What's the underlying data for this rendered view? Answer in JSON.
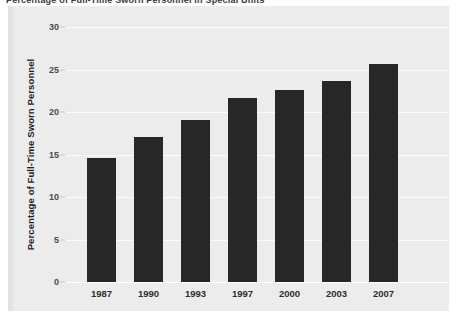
{
  "figure": {
    "top_caption_partial": "Percentage of Full-Time Sworn Personnel in Special Units",
    "background_color": "#ececed",
    "bar_color": "#272727",
    "gridline_color": "#fbfbfb"
  },
  "chart_data": {
    "type": "bar",
    "title": "",
    "xlabel": "",
    "ylabel": "Percentage of Full-Time Sworn Personnel",
    "categories": [
      "1987",
      "1990",
      "1993",
      "1997",
      "2000",
      "2003",
      "2007"
    ],
    "values": [
      14.6,
      17.1,
      19.1,
      21.7,
      22.6,
      23.7,
      25.6
    ],
    "ylim": [
      0,
      30
    ],
    "yticks": [
      0,
      5,
      10,
      15,
      20,
      25,
      30
    ],
    "ytick_labels": [
      "0",
      "5",
      "10",
      "15",
      "20",
      "25",
      "30"
    ],
    "grid": true,
    "legend": "none",
    "series": [
      {
        "name": "Percentage of Full-Time Sworn Personnel",
        "values": [
          14.6,
          17.1,
          19.1,
          21.7,
          22.6,
          23.7,
          25.6
        ]
      }
    ]
  }
}
